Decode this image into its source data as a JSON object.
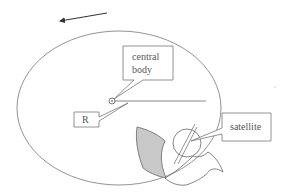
{
  "diagram": {
    "type": "orbit-schematic",
    "labels": {
      "central_body_line1": "central",
      "central_body_line2": "body",
      "radius": "R",
      "satellite": "satellite"
    },
    "colors": {
      "stroke": "#6e6e6e",
      "panel_fill": "#c8c8c8",
      "background": "#ffffff",
      "text": "#555555"
    },
    "direction_arrow": "counter-clockwise (pointing left)"
  }
}
